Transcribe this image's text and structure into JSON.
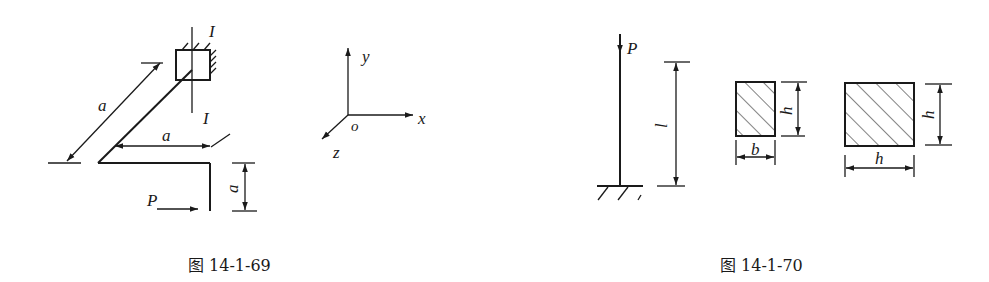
{
  "figures": [
    {
      "id": "fig-14-1-69",
      "caption": "图 14-1-69",
      "labels": {
        "section_top": "I",
        "section_bottom": "I",
        "dim_diagonal": "a",
        "dim_horizontal": "a",
        "dim_vertical": "a",
        "load": "P"
      },
      "axes": {
        "y": "y",
        "x": "x",
        "z": "z",
        "origin": "o"
      }
    },
    {
      "id": "fig-14-1-70",
      "caption": "图 14-1-70",
      "labels": {
        "load": "P",
        "length": "l",
        "rect_height": "h",
        "rect_width": "b",
        "square_height": "h",
        "square_width": "h"
      }
    }
  ],
  "colors": {
    "ink": "#1a1a1a",
    "background": "#ffffff"
  }
}
